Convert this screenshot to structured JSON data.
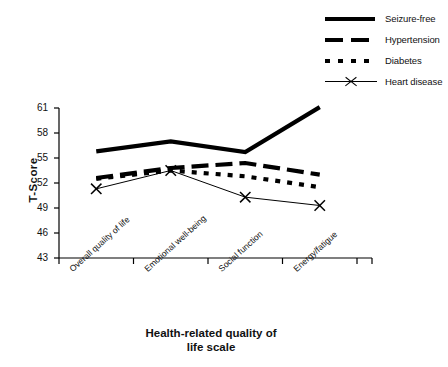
{
  "chart_data": {
    "type": "line",
    "title": "",
    "xlabel": "Health-related quality of life scale",
    "ylabel": "T-Score",
    "categories": [
      "Overall quality of life",
      "Emotional well-being",
      "Social function",
      "Energy/fatigue"
    ],
    "yticks": [
      43,
      46,
      49,
      52,
      55,
      58,
      61
    ],
    "ylim": [
      43,
      61
    ],
    "grid": false,
    "legend_position": "top-right",
    "series": [
      {
        "name": "Seizure-free",
        "style": "solid-thick",
        "color": "#000000",
        "values": [
          55.8,
          57.0,
          55.7,
          61.1
        ]
      },
      {
        "name": "Hypertension",
        "style": "dashed-thick",
        "color": "#000000",
        "values": [
          52.6,
          53.8,
          54.4,
          53.0
        ]
      },
      {
        "name": "Diabetes",
        "style": "dotted-thick",
        "color": "#000000",
        "values": [
          52.5,
          53.5,
          52.8,
          51.5
        ]
      },
      {
        "name": "Heart disease",
        "style": "thin-x-marker",
        "color": "#000000",
        "values": [
          51.3,
          53.5,
          50.3,
          49.3
        ]
      }
    ]
  },
  "legend": {
    "items": [
      {
        "label": "Seizure-free",
        "key": "solid-line-key"
      },
      {
        "label": "Hypertension",
        "key": "dashed-line-key"
      },
      {
        "label": "Diabetes",
        "key": "dotted-line-key"
      },
      {
        "label": "Heart disease",
        "key": "x-marker-line-key"
      }
    ]
  },
  "axes": {
    "y_title": "T-Score",
    "x_title_line1": "Health-related quality of",
    "x_title_line2": "life scale",
    "y_tick_labels": [
      "61",
      "58",
      "55",
      "52",
      "49",
      "46",
      "43"
    ],
    "x_tick_labels": [
      "Overall quality of life",
      "Emotional well-being",
      "Social function",
      "Energy/fatigue"
    ]
  }
}
